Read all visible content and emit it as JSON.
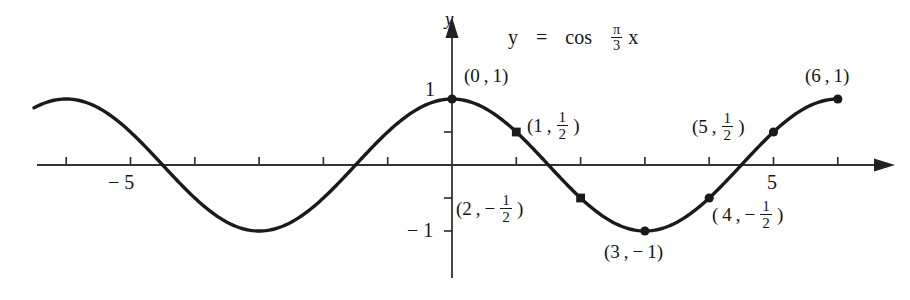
{
  "figure": {
    "name": "cosine-graph",
    "equation": {
      "lhs": "y",
      "equals": "=",
      "fn": "cos",
      "frac_num": "π",
      "frac_den": "3",
      "var": "x",
      "plain": "y = cos (π/3)x"
    },
    "axes": {
      "x_axis_label": "",
      "y_axis_label": "y",
      "x_ticks": [
        {
          "value": -6,
          "label": ""
        },
        {
          "value": -5,
          "label": "− 5"
        },
        {
          "value": -4,
          "label": ""
        },
        {
          "value": -3,
          "label": ""
        },
        {
          "value": -2,
          "label": ""
        },
        {
          "value": -1,
          "label": ""
        },
        {
          "value": 1,
          "label": ""
        },
        {
          "value": 2,
          "label": ""
        },
        {
          "value": 3,
          "label": ""
        },
        {
          "value": 4,
          "label": ""
        },
        {
          "value": 5,
          "label": "5"
        },
        {
          "value": 6,
          "label": ""
        }
      ],
      "y_ticks": [
        {
          "value": 1,
          "label": "1"
        },
        {
          "value": 0.5,
          "label": ""
        },
        {
          "value": -0.5,
          "label": ""
        },
        {
          "value": -1,
          "label": "− 1"
        }
      ],
      "x_range": [
        -6.5,
        6.7
      ],
      "y_range": [
        -1.45,
        1.45
      ]
    },
    "points": [
      {
        "name": "point-0-1",
        "x": 0,
        "y": 1,
        "label_plain": "(0 , 1)",
        "label_x": 0,
        "label_y": 1,
        "has_fraction": false,
        "sign": "",
        "whole": "0",
        "num": "",
        "den": ""
      },
      {
        "name": "point-1-half",
        "x": 1,
        "y": 0.5,
        "label_plain": "(1 , 1/2)",
        "label_x": 1,
        "label_y": 0.5,
        "has_fraction": true,
        "sign": "",
        "whole": "1",
        "num": "1",
        "den": "2"
      },
      {
        "name": "point-2-neg-half",
        "x": 2,
        "y": -0.5,
        "label_plain": "(2 , − 1/2)",
        "label_x": 2,
        "label_y": -0.5,
        "has_fraction": true,
        "sign": "−",
        "whole": "2",
        "num": "1",
        "den": "2"
      },
      {
        "name": "point-3-neg-1",
        "x": 3,
        "y": -1,
        "label_plain": "(3 , − 1)",
        "label_x": 3,
        "label_y": -1,
        "has_fraction": false,
        "sign": "−",
        "whole": "3",
        "num": "",
        "den": ""
      },
      {
        "name": "point-4-neg-half",
        "x": 4,
        "y": -0.5,
        "label_plain": "(4 , − 1/2)",
        "label_x": 4,
        "label_y": -0.5,
        "has_fraction": true,
        "sign": "−",
        "whole": "4",
        "num": "1",
        "den": "2"
      },
      {
        "name": "point-5-half",
        "x": 5,
        "y": 0.5,
        "label_plain": "(5 , 1/2)",
        "label_x": 5,
        "label_y": 0.5,
        "has_fraction": true,
        "sign": "",
        "whole": "5",
        "num": "1",
        "den": "2"
      },
      {
        "name": "point-6-1",
        "x": 6,
        "y": 1,
        "label_plain": "(6 , 1)",
        "label_x": 6,
        "label_y": 1,
        "has_fraction": false,
        "sign": "",
        "whole": "6",
        "num": "",
        "den": ""
      }
    ],
    "colors": {
      "curve": "#1a1a1a",
      "axis": "#333333",
      "text": "#141414",
      "background": "#ffffff"
    }
  },
  "chart_data": {
    "type": "line",
    "xlabel": "x",
    "ylabel": "y",
    "xlim": [
      -6.5,
      6.7
    ],
    "ylim": [
      -1.45,
      1.45
    ],
    "grid": false,
    "legend": "none",
    "function": "y = cos(pi*x/3)",
    "period": 6,
    "amplitude": 1,
    "domain_drawn": [
      -6.5,
      6
    ],
    "x_tick_values": [
      -6,
      -5,
      -4,
      -3,
      -2,
      -1,
      1,
      2,
      3,
      4,
      5,
      6
    ],
    "x_tick_labels_shown": {
      "-5": "− 5",
      "5": "5"
    },
    "y_tick_values": [
      1,
      0.5,
      -0.5,
      -1
    ],
    "y_tick_labels_shown": {
      "1": "1",
      "-1": "− 1"
    },
    "marked_points": [
      {
        "x": 0,
        "y": 1
      },
      {
        "x": 1,
        "y": 0.5
      },
      {
        "x": 2,
        "y": -0.5
      },
      {
        "x": 3,
        "y": -1
      },
      {
        "x": 4,
        "y": -0.5
      },
      {
        "x": 5,
        "y": 0.5
      },
      {
        "x": 6,
        "y": 1
      }
    ],
    "annotations": [
      "(0 , 1)",
      "(1 , 1/2)",
      "(2 , − 1/2)",
      "(3 , − 1)",
      "(4 , − 1/2)",
      "(5 , 1/2)",
      "(6 , 1)"
    ]
  }
}
